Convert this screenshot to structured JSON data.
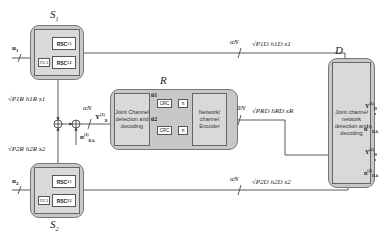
{
  "nodes": {
    "s1": {
      "title": "S",
      "sub": "1",
      "rsc_top": "RSC",
      "rsc_top_sub": "1,1",
      "rsc_bottom": "RSC",
      "rsc_bottom_sub": "1,2",
      "interleaver": "Π1,1",
      "input": "u",
      "input_sub": "1"
    },
    "s2": {
      "title": "S",
      "sub": "2",
      "rsc_top": "RSC",
      "rsc_top_sub": "2,1",
      "rsc_bottom": "RSC",
      "rsc_bottom_sub": "2,2",
      "interleaver": "Π2,1",
      "input": "u",
      "input_sub": "2"
    },
    "r": {
      "title": "R",
      "detector": "Joint Channel detection and decoding",
      "crc": "CRC",
      "pi": "π",
      "encoder": "Network/ channel Encoder",
      "u1_hat": "û1",
      "u2_hat": "û2"
    },
    "d": {
      "title": "D",
      "detector": "Joint channel network detection and decoding"
    }
  },
  "links": {
    "s1_to_d": {
      "slash": "αN",
      "signal": "√P1D h1D x1"
    },
    "s2_to_d": {
      "slash": "αN",
      "signal": "√P2D h2D x2"
    },
    "r_to_d": {
      "slash": "ᾱN",
      "signal": "√PRD hRD xR"
    },
    "s1_to_r": {
      "signal": "√P1R h1R x1"
    },
    "s2_to_r": {
      "signal": "√P2R h2R x2"
    },
    "r_in": {
      "slash": "αN",
      "y": "Y",
      "y_sup": "(1)",
      "y_sub": "R",
      "noise": "n",
      "noise_sup": "(1)",
      "noise_sub": "R,k"
    },
    "d_in1": {
      "y": "Y",
      "y_sup": "(1)",
      "y_sub": "D",
      "noise": "n",
      "noise_sup": "(1)",
      "noise_sub": "D,k"
    },
    "d_in2": {
      "y": "Y",
      "y_sup": "(2)",
      "y_sub": "D",
      "noise": "n",
      "noise_sup": "(2)",
      "noise_sub": "D,k"
    }
  }
}
